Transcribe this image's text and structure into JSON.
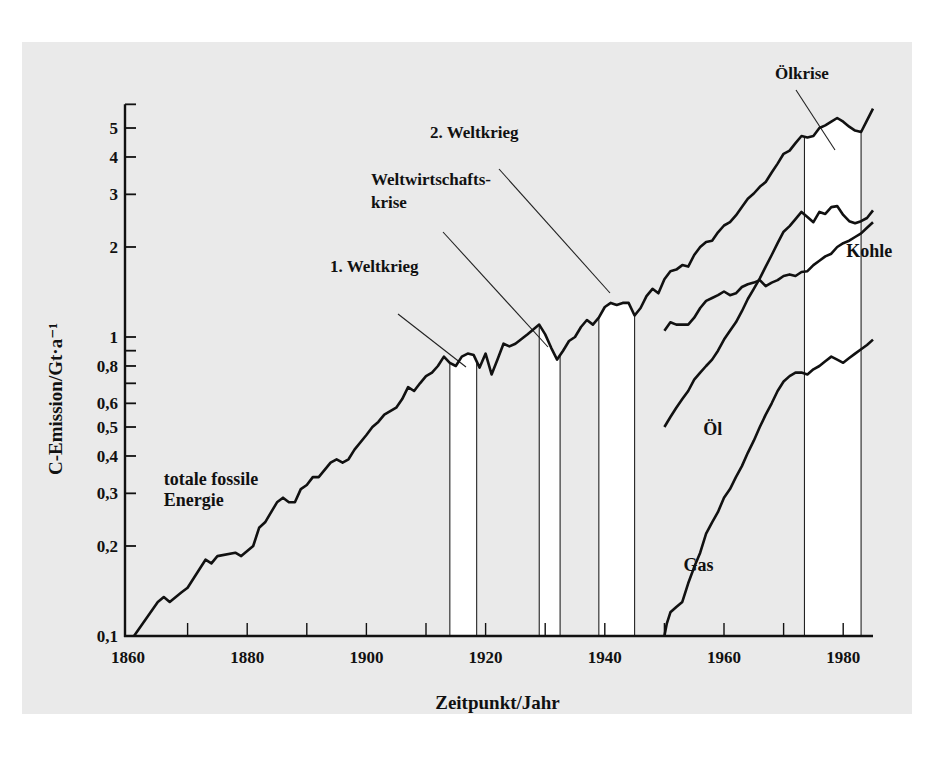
{
  "chart_data": {
    "type": "line",
    "title": "",
    "xlabel": "Zeitpunkt/Jahr",
    "ylabel": "C-Emission/Gt·a⁻¹",
    "yscale": "log",
    "xlim": [
      1860,
      1985
    ],
    "ylim": [
      0.1,
      6
    ],
    "grid": false,
    "x_ticks": [
      1860,
      1880,
      1900,
      1920,
      1940,
      1960,
      1980
    ],
    "x_minor_ticks": [
      1870,
      1890,
      1910,
      1930,
      1950,
      1970
    ],
    "y_ticks": [
      {
        "value": 0.1,
        "label": "0,1"
      },
      {
        "value": 0.2,
        "label": "0,2"
      },
      {
        "value": 0.3,
        "label": "0,3"
      },
      {
        "value": 0.4,
        "label": "0,4"
      },
      {
        "value": 0.5,
        "label": "0,5"
      },
      {
        "value": 0.6,
        "label": "0,6"
      },
      {
        "value": 0.7,
        "label": ""
      },
      {
        "value": 0.8,
        "label": "0,8"
      },
      {
        "value": 0.9,
        "label": ""
      },
      {
        "value": 1,
        "label": "1"
      },
      {
        "value": 2,
        "label": "2"
      },
      {
        "value": 3,
        "label": "3"
      },
      {
        "value": 4,
        "label": "4"
      },
      {
        "value": 5,
        "label": "5"
      },
      {
        "value": 6,
        "label": ""
      }
    ],
    "series": [
      {
        "name": "totale fossile Energie",
        "label_pos": {
          "year": 1866,
          "value": 0.32
        },
        "points": [
          [
            1861,
            0.1
          ],
          [
            1865,
            0.13
          ],
          [
            1866,
            0.135
          ],
          [
            1867,
            0.13
          ],
          [
            1869,
            0.14
          ],
          [
            1870,
            0.145
          ],
          [
            1873,
            0.18
          ],
          [
            1874,
            0.175
          ],
          [
            1875,
            0.185
          ],
          [
            1878,
            0.19
          ],
          [
            1879,
            0.185
          ],
          [
            1881,
            0.2
          ],
          [
            1882,
            0.23
          ],
          [
            1883,
            0.24
          ],
          [
            1885,
            0.28
          ],
          [
            1886,
            0.29
          ],
          [
            1887,
            0.28
          ],
          [
            1888,
            0.28
          ],
          [
            1889,
            0.31
          ],
          [
            1890,
            0.32
          ],
          [
            1891,
            0.34
          ],
          [
            1892,
            0.34
          ],
          [
            1894,
            0.38
          ],
          [
            1895,
            0.39
          ],
          [
            1896,
            0.38
          ],
          [
            1897,
            0.39
          ],
          [
            1898,
            0.42
          ],
          [
            1900,
            0.47
          ],
          [
            1901,
            0.5
          ],
          [
            1902,
            0.52
          ],
          [
            1903,
            0.55
          ],
          [
            1905,
            0.58
          ],
          [
            1906,
            0.62
          ],
          [
            1907,
            0.68
          ],
          [
            1908,
            0.66
          ],
          [
            1909,
            0.7
          ],
          [
            1910,
            0.74
          ],
          [
            1911,
            0.76
          ],
          [
            1912,
            0.8
          ],
          [
            1913,
            0.86
          ],
          [
            1914,
            0.82
          ],
          [
            1915,
            0.8
          ],
          [
            1916,
            0.86
          ],
          [
            1917,
            0.88
          ],
          [
            1918,
            0.87
          ],
          [
            1919,
            0.79
          ],
          [
            1920,
            0.88
          ],
          [
            1921,
            0.75
          ],
          [
            1922,
            0.84
          ],
          [
            1923,
            0.95
          ],
          [
            1924,
            0.93
          ],
          [
            1925,
            0.95
          ],
          [
            1927,
            1.02
          ],
          [
            1929,
            1.1
          ],
          [
            1930,
            1.02
          ],
          [
            1931,
            0.92
          ],
          [
            1932,
            0.84
          ],
          [
            1933,
            0.9
          ],
          [
            1934,
            0.97
          ],
          [
            1935,
            1.0
          ],
          [
            1936,
            1.08
          ],
          [
            1937,
            1.14
          ],
          [
            1938,
            1.1
          ],
          [
            1939,
            1.16
          ],
          [
            1940,
            1.26
          ],
          [
            1941,
            1.3
          ],
          [
            1942,
            1.28
          ],
          [
            1943,
            1.3
          ],
          [
            1944,
            1.3
          ],
          [
            1945,
            1.18
          ],
          [
            1946,
            1.25
          ],
          [
            1947,
            1.37
          ],
          [
            1948,
            1.45
          ],
          [
            1949,
            1.4
          ],
          [
            1950,
            1.56
          ],
          [
            1951,
            1.66
          ],
          [
            1952,
            1.68
          ],
          [
            1953,
            1.74
          ],
          [
            1954,
            1.72
          ],
          [
            1955,
            1.88
          ],
          [
            1956,
            2.0
          ],
          [
            1957,
            2.08
          ],
          [
            1958,
            2.1
          ],
          [
            1959,
            2.24
          ],
          [
            1960,
            2.36
          ],
          [
            1961,
            2.42
          ],
          [
            1962,
            2.55
          ],
          [
            1963,
            2.72
          ],
          [
            1964,
            2.9
          ],
          [
            1965,
            3.02
          ],
          [
            1966,
            3.18
          ],
          [
            1967,
            3.3
          ],
          [
            1968,
            3.55
          ],
          [
            1969,
            3.8
          ],
          [
            1970,
            4.1
          ],
          [
            1971,
            4.2
          ],
          [
            1972,
            4.45
          ],
          [
            1973,
            4.7
          ],
          [
            1974,
            4.65
          ],
          [
            1975,
            4.7
          ],
          [
            1976,
            5.0
          ],
          [
            1977,
            5.1
          ],
          [
            1978,
            5.25
          ],
          [
            1979,
            5.4
          ],
          [
            1980,
            5.25
          ],
          [
            1981,
            5.05
          ],
          [
            1982,
            4.9
          ],
          [
            1983,
            4.85
          ],
          [
            1984,
            5.3
          ],
          [
            1985,
            5.8
          ]
        ]
      },
      {
        "name": "Kohle",
        "label_pos": {
          "year": 1980.5,
          "value": 1.85
        },
        "points": [
          [
            1950,
            1.05
          ],
          [
            1951,
            1.12
          ],
          [
            1952,
            1.1
          ],
          [
            1953,
            1.1
          ],
          [
            1954,
            1.1
          ],
          [
            1955,
            1.16
          ],
          [
            1956,
            1.25
          ],
          [
            1957,
            1.32
          ],
          [
            1958,
            1.35
          ],
          [
            1959,
            1.38
          ],
          [
            1960,
            1.42
          ],
          [
            1961,
            1.38
          ],
          [
            1962,
            1.4
          ],
          [
            1963,
            1.47
          ],
          [
            1964,
            1.5
          ],
          [
            1965,
            1.52
          ],
          [
            1966,
            1.55
          ],
          [
            1967,
            1.48
          ],
          [
            1968,
            1.52
          ],
          [
            1969,
            1.55
          ],
          [
            1970,
            1.6
          ],
          [
            1971,
            1.62
          ],
          [
            1972,
            1.6
          ],
          [
            1973,
            1.65
          ],
          [
            1974,
            1.66
          ],
          [
            1975,
            1.74
          ],
          [
            1976,
            1.8
          ],
          [
            1977,
            1.86
          ],
          [
            1978,
            1.9
          ],
          [
            1979,
            2.0
          ],
          [
            1980,
            2.06
          ],
          [
            1981,
            2.1
          ],
          [
            1982,
            2.16
          ],
          [
            1983,
            2.22
          ],
          [
            1984,
            2.32
          ],
          [
            1985,
            2.42
          ]
        ]
      },
      {
        "name": "Öl",
        "label_pos": {
          "year": 1956.5,
          "value": 0.47
        },
        "points": [
          [
            1950,
            0.5
          ],
          [
            1951,
            0.54
          ],
          [
            1952,
            0.58
          ],
          [
            1953,
            0.62
          ],
          [
            1954,
            0.66
          ],
          [
            1955,
            0.72
          ],
          [
            1956,
            0.76
          ],
          [
            1957,
            0.8
          ],
          [
            1958,
            0.84
          ],
          [
            1959,
            0.9
          ],
          [
            1960,
            0.98
          ],
          [
            1961,
            1.05
          ],
          [
            1962,
            1.12
          ],
          [
            1963,
            1.22
          ],
          [
            1964,
            1.34
          ],
          [
            1965,
            1.45
          ],
          [
            1966,
            1.57
          ],
          [
            1967,
            1.72
          ],
          [
            1968,
            1.88
          ],
          [
            1969,
            2.06
          ],
          [
            1970,
            2.25
          ],
          [
            1971,
            2.35
          ],
          [
            1972,
            2.48
          ],
          [
            1973,
            2.62
          ],
          [
            1974,
            2.52
          ],
          [
            1975,
            2.42
          ],
          [
            1976,
            2.62
          ],
          [
            1977,
            2.58
          ],
          [
            1978,
            2.72
          ],
          [
            1979,
            2.74
          ],
          [
            1980,
            2.56
          ],
          [
            1981,
            2.44
          ],
          [
            1982,
            2.4
          ],
          [
            1983,
            2.44
          ],
          [
            1984,
            2.5
          ],
          [
            1985,
            2.65
          ]
        ]
      },
      {
        "name": "Gas",
        "label_pos": {
          "year": 1953.2,
          "value": 0.165
        },
        "points": [
          [
            1950,
            0.1
          ],
          [
            1950.4,
            0.11
          ],
          [
            1951,
            0.12
          ],
          [
            1952,
            0.125
          ],
          [
            1953,
            0.13
          ],
          [
            1954,
            0.15
          ],
          [
            1955,
            0.17
          ],
          [
            1956,
            0.19
          ],
          [
            1957,
            0.22
          ],
          [
            1958,
            0.24
          ],
          [
            1959,
            0.26
          ],
          [
            1960,
            0.29
          ],
          [
            1961,
            0.31
          ],
          [
            1962,
            0.34
          ],
          [
            1963,
            0.37
          ],
          [
            1964,
            0.41
          ],
          [
            1965,
            0.45
          ],
          [
            1966,
            0.5
          ],
          [
            1967,
            0.55
          ],
          [
            1968,
            0.6
          ],
          [
            1969,
            0.66
          ],
          [
            1970,
            0.71
          ],
          [
            1971,
            0.74
          ],
          [
            1972,
            0.76
          ],
          [
            1973,
            0.76
          ],
          [
            1974,
            0.75
          ],
          [
            1975,
            0.78
          ],
          [
            1976,
            0.8
          ],
          [
            1977,
            0.83
          ],
          [
            1978,
            0.86
          ],
          [
            1979,
            0.84
          ],
          [
            1980,
            0.82
          ],
          [
            1981,
            0.85
          ],
          [
            1982,
            0.88
          ],
          [
            1983,
            0.91
          ],
          [
            1984,
            0.94
          ],
          [
            1985,
            0.98
          ]
        ]
      }
    ],
    "shaded_periods": [
      {
        "start": 1914,
        "end": 1918.5,
        "name": "1. Weltkrieg"
      },
      {
        "start": 1929,
        "end": 1932.5,
        "name": "Weltwirtschaftskrise"
      },
      {
        "start": 1939,
        "end": 1945,
        "name": "2. Weltkrieg"
      },
      {
        "start": 1973.5,
        "end": 1983,
        "name": "Ölkrise"
      }
    ],
    "annotations": [
      {
        "text": [
          "1. Weltkrieg"
        ],
        "x": 330,
        "y": 272,
        "line": [
          398,
          314,
          466,
          367
        ]
      },
      {
        "text": [
          "Weltwirtschafts-",
          "krise"
        ],
        "x": 371,
        "y": 185,
        "line": [
          443,
          232,
          548,
          347
        ]
      },
      {
        "text": [
          "2. Weltkrieg"
        ],
        "x": 430,
        "y": 138,
        "line": [
          499,
          169,
          610,
          293
        ]
      },
      {
        "text": [
          "Ölkrise"
        ],
        "x": 802,
        "y": 79,
        "line": [
          796,
          90,
          835,
          150
        ]
      }
    ]
  }
}
